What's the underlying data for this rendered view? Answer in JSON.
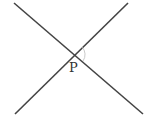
{
  "diagram": {
    "title": "",
    "point_label": "P",
    "lines": [
      {
        "name": "line-1",
        "x1": 14,
        "y1": 3,
        "x2": 143,
        "y2": 114
      },
      {
        "name": "line-2",
        "x1": 128,
        "y1": 3,
        "x2": 15,
        "y2": 114
      }
    ],
    "intersection": {
      "x": 74,
      "y": 54
    },
    "angle_arc": {
      "from_angle_deg": -45,
      "to_angle_deg": 40
    },
    "colors": {
      "line": "#444444",
      "arc": "#bbbbbb",
      "label": "#333333"
    }
  }
}
